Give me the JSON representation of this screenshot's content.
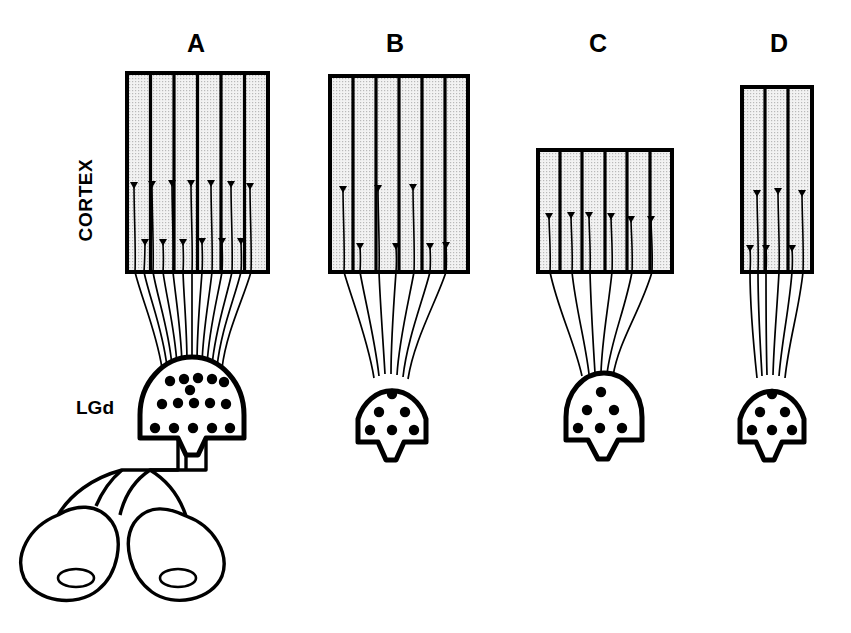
{
  "figure": {
    "type": "schematic-diagram",
    "background_color": "#ffffff",
    "ink_color": "#000000",
    "cortex_fill_color": "#e8e8e8",
    "width": 851,
    "height": 633
  },
  "labels": {
    "cortex": "CORTEX",
    "lgd": "LGd"
  },
  "panels": [
    {
      "id": "A",
      "label": "A",
      "label_x": 196,
      "label_y": 52,
      "cortex": {
        "x": 127,
        "y": 73,
        "width": 141,
        "height": 199,
        "columns": 6,
        "column_count_label": "6"
      },
      "lgd": {
        "cx": 192,
        "cy": 415,
        "rx": 52,
        "ry": 58,
        "dot_rows": [
          5,
          6,
          5
        ],
        "dot_total": 16,
        "size": "large"
      },
      "afferents": {
        "count": 13,
        "upper_terminal_y": 182,
        "lower_terminal_y": 241
      },
      "has_optic_pathway": true,
      "eyes": {
        "count": 2,
        "left_cx": 86,
        "left_cy": 547,
        "right_cx": 196,
        "right_cy": 547,
        "pupil_label": "pupil"
      }
    },
    {
      "id": "B",
      "label": "B",
      "label_x": 395,
      "label_y": 52,
      "cortex": {
        "x": 330,
        "y": 76,
        "width": 138,
        "height": 196,
        "columns": 6,
        "column_count_label": "6"
      },
      "lgd": {
        "cx": 392,
        "cy": 417,
        "rx": 36,
        "ry": 42,
        "dot_rows": [
          1,
          2,
          3
        ],
        "dot_total": 6,
        "size": "small"
      },
      "afferents": {
        "count": 7,
        "upper_terminal_y": 186,
        "lower_terminal_y": 243
      },
      "has_optic_pathway": false
    },
    {
      "id": "C",
      "label": "C",
      "label_x": 598,
      "label_y": 52,
      "cortex": {
        "x": 538,
        "y": 150,
        "width": 134,
        "height": 122,
        "columns": 6,
        "column_count_label": "6"
      },
      "lgd": {
        "cx": 600,
        "cy": 415,
        "rx": 38,
        "ry": 44,
        "dot_rows": [
          1,
          2,
          3
        ],
        "dot_total": 6,
        "size": "small"
      },
      "afferents": {
        "count": 6,
        "upper_terminal_y": 213,
        "lower_terminal_y": 213
      },
      "has_optic_pathway": false
    },
    {
      "id": "D",
      "label": "D",
      "label_x": 779,
      "label_y": 52,
      "cortex": {
        "x": 742,
        "y": 87,
        "width": 70,
        "height": 185,
        "columns": 3,
        "column_count_label": "3"
      },
      "lgd": {
        "cx": 772,
        "cy": 417,
        "rx": 34,
        "ry": 42,
        "dot_rows": [
          1,
          2,
          3
        ],
        "dot_total": 6,
        "size": "small"
      },
      "afferents": {
        "count": 6,
        "upper_terminal_y": 190,
        "lower_terminal_y": 245
      },
      "has_optic_pathway": false
    }
  ]
}
